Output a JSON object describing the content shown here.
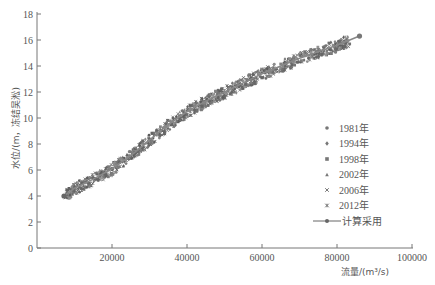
{
  "chart_data": {
    "type": "scatter",
    "title": "",
    "xlabel": "流量/(m³/s)",
    "ylabel": "水位/(m，冻结吴淞)",
    "xlim": [
      0,
      100000
    ],
    "ylim": [
      0,
      18
    ],
    "x_ticks": [
      20000,
      40000,
      60000,
      80000,
      100000
    ],
    "x_tick_labels": [
      "20000",
      "40000",
      "60000",
      "80000",
      "100000"
    ],
    "y_ticks": [
      0,
      2,
      4,
      6,
      8,
      10,
      12,
      14,
      16,
      18
    ],
    "y_tick_labels": [
      "0",
      "2",
      "4",
      "6",
      "8",
      "10",
      "12",
      "14",
      "16",
      "18"
    ],
    "grid": false,
    "legend_position": "right",
    "series": [
      {
        "name": "1981年",
        "marker": "circle",
        "x": [
          9000,
          15000,
          22000,
          30000,
          38000,
          46000,
          54000
        ],
        "y": [
          4.5,
          5.4,
          6.6,
          8.4,
          10.0,
          11.3,
          12.5
        ]
      },
      {
        "name": "1994年",
        "marker": "diamond",
        "x": [
          10000,
          18000,
          26000,
          34000,
          42000,
          50000,
          58000,
          66000
        ],
        "y": [
          4.7,
          5.8,
          7.3,
          9.0,
          10.6,
          11.7,
          12.8,
          13.7
        ]
      },
      {
        "name": "1998年",
        "marker": "square",
        "x": [
          12000,
          20000,
          28000,
          36000,
          44000,
          52000,
          60000,
          68000,
          76000,
          82000
        ],
        "y": [
          5.0,
          6.1,
          7.7,
          9.5,
          10.9,
          12.0,
          13.1,
          14.1,
          14.9,
          15.5
        ]
      },
      {
        "name": "2002年",
        "marker": "triangle",
        "x": [
          8000,
          16000,
          24000,
          32000,
          40000,
          48000,
          56000,
          64000
        ],
        "y": [
          4.3,
          5.7,
          7.2,
          9.1,
          10.6,
          11.8,
          12.9,
          13.8
        ]
      },
      {
        "name": "2006年",
        "marker": "x",
        "x": [
          8000,
          14000,
          20000,
          27000,
          34000,
          41000,
          48000
        ],
        "y": [
          4.1,
          5.0,
          6.0,
          7.4,
          8.9,
          10.2,
          11.3
        ]
      },
      {
        "name": "2012年",
        "marker": "asterisk",
        "x": [
          10000,
          18000,
          26000,
          34000,
          42000,
          50000,
          58000,
          66000,
          74000,
          80000
        ],
        "y": [
          4.4,
          5.7,
          7.1,
          8.8,
          10.4,
          11.6,
          12.7,
          13.7,
          14.6,
          15.3
        ]
      },
      {
        "name": "计算采用",
        "marker": "line-with-dots",
        "x": [
          7200,
          10000,
          15000,
          20000,
          25000,
          30000,
          35000,
          40000,
          45000,
          50000,
          55000,
          60000,
          65000,
          70000,
          75000,
          80000,
          86000
        ],
        "y": [
          4.0,
          4.6,
          5.3,
          6.1,
          7.1,
          8.3,
          9.5,
          10.5,
          11.3,
          12.0,
          12.7,
          13.4,
          14.0,
          14.6,
          15.1,
          15.6,
          16.3
        ]
      }
    ]
  },
  "legend": {
    "items": [
      {
        "label": "1981年",
        "marker": "circle"
      },
      {
        "label": "1994年",
        "marker": "diamond"
      },
      {
        "label": "1998年",
        "marker": "square"
      },
      {
        "label": "2002年",
        "marker": "triangle"
      },
      {
        "label": "2006年",
        "marker": "x"
      },
      {
        "label": "2012年",
        "marker": "asterisk"
      },
      {
        "label": "计算采用",
        "marker": "line-with-dots"
      }
    ]
  },
  "axes": {
    "xlabel": "流量/(m³/s)",
    "ylabel": "水位/(m，冻结吴淞)"
  },
  "colors": {
    "axis": "#777777",
    "points": "#666666",
    "curve": "#555555"
  }
}
